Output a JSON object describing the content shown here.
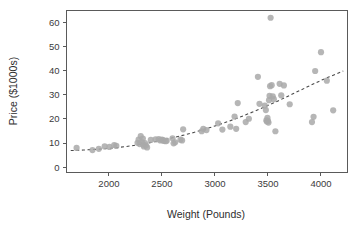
{
  "chart_data": {
    "type": "scatter",
    "title": "",
    "xlabel": "Weight (Pounds)",
    "ylabel": "Price ($1000s)",
    "xlim": [
      1600,
      4250
    ],
    "ylim": [
      -2,
      65
    ],
    "xticks": [
      2000,
      2500,
      3000,
      3500,
      4000
    ],
    "xtick_labels": [
      "2000",
      "2500",
      "3000",
      "3500",
      "4000"
    ],
    "yticks": [
      0,
      10,
      20,
      30,
      40,
      50,
      60
    ],
    "ytick_labels": [
      "0",
      "10",
      "20",
      "30",
      "40",
      "50",
      "60"
    ],
    "grid": false,
    "legend": null,
    "point_color": "#a9a9a9",
    "point_radius": 3.1,
    "axis_color": "#5a5a5a",
    "background": "#ffffff",
    "points": [
      {
        "x": 1695,
        "y": 8.0
      },
      {
        "x": 1845,
        "y": 7.1
      },
      {
        "x": 1905,
        "y": 7.6
      },
      {
        "x": 1960,
        "y": 8.6
      },
      {
        "x": 2005,
        "y": 8.4
      },
      {
        "x": 2050,
        "y": 9.2
      },
      {
        "x": 2070,
        "y": 8.8
      },
      {
        "x": 2270,
        "y": 10.1
      },
      {
        "x": 2280,
        "y": 11.4
      },
      {
        "x": 2290,
        "y": 9.6
      },
      {
        "x": 2300,
        "y": 12.9
      },
      {
        "x": 2310,
        "y": 10.4
      },
      {
        "x": 2320,
        "y": 11.9
      },
      {
        "x": 2325,
        "y": 9.3
      },
      {
        "x": 2330,
        "y": 8.6
      },
      {
        "x": 2340,
        "y": 10.0
      },
      {
        "x": 2350,
        "y": 9.0
      },
      {
        "x": 2360,
        "y": 8.2
      },
      {
        "x": 2395,
        "y": 11.3
      },
      {
        "x": 2440,
        "y": 11.5
      },
      {
        "x": 2470,
        "y": 11.6
      },
      {
        "x": 2485,
        "y": 11.1
      },
      {
        "x": 2500,
        "y": 11.4
      },
      {
        "x": 2510,
        "y": 11.2
      },
      {
        "x": 2520,
        "y": 10.9
      },
      {
        "x": 2535,
        "y": 10.8
      },
      {
        "x": 2545,
        "y": 11.0
      },
      {
        "x": 2600,
        "y": 12.0
      },
      {
        "x": 2610,
        "y": 9.9
      },
      {
        "x": 2625,
        "y": 10.3
      },
      {
        "x": 2675,
        "y": 11.4
      },
      {
        "x": 2690,
        "y": 11.1
      },
      {
        "x": 2700,
        "y": 15.7
      },
      {
        "x": 2875,
        "y": 14.9
      },
      {
        "x": 2890,
        "y": 15.9
      },
      {
        "x": 2920,
        "y": 15.4
      },
      {
        "x": 3030,
        "y": 18.2
      },
      {
        "x": 3070,
        "y": 15.6
      },
      {
        "x": 3145,
        "y": 16.8
      },
      {
        "x": 3185,
        "y": 21.0
      },
      {
        "x": 3200,
        "y": 15.9
      },
      {
        "x": 3215,
        "y": 26.6
      },
      {
        "x": 3290,
        "y": 18.7
      },
      {
        "x": 3320,
        "y": 20.1
      },
      {
        "x": 3405,
        "y": 37.5
      },
      {
        "x": 3420,
        "y": 26.3
      },
      {
        "x": 3470,
        "y": 25.5
      },
      {
        "x": 3480,
        "y": 23.7
      },
      {
        "x": 3485,
        "y": 19.4
      },
      {
        "x": 3490,
        "y": 18.9
      },
      {
        "x": 3495,
        "y": 20.5
      },
      {
        "x": 3500,
        "y": 19.2
      },
      {
        "x": 3505,
        "y": 18.5
      },
      {
        "x": 3510,
        "y": 27.8
      },
      {
        "x": 3515,
        "y": 29.6
      },
      {
        "x": 3520,
        "y": 33.6
      },
      {
        "x": 3525,
        "y": 62.0
      },
      {
        "x": 3535,
        "y": 34.0
      },
      {
        "x": 3545,
        "y": 29.4
      },
      {
        "x": 3555,
        "y": 28.2
      },
      {
        "x": 3570,
        "y": 14.9
      },
      {
        "x": 3610,
        "y": 34.6
      },
      {
        "x": 3625,
        "y": 29.8
      },
      {
        "x": 3650,
        "y": 33.9
      },
      {
        "x": 3705,
        "y": 26.1
      },
      {
        "x": 3915,
        "y": 18.7
      },
      {
        "x": 3930,
        "y": 20.9
      },
      {
        "x": 3945,
        "y": 39.9
      },
      {
        "x": 4000,
        "y": 47.7
      },
      {
        "x": 4055,
        "y": 35.9
      },
      {
        "x": 4115,
        "y": 23.6
      }
    ],
    "trend": {
      "style": "dashed",
      "description": "fitted quadratic trend",
      "points": [
        {
          "x": 1640,
          "y": 6.9
        },
        {
          "x": 1800,
          "y": 7.2
        },
        {
          "x": 2000,
          "y": 7.8
        },
        {
          "x": 2200,
          "y": 8.8
        },
        {
          "x": 2400,
          "y": 10.3
        },
        {
          "x": 2600,
          "y": 12.2
        },
        {
          "x": 2800,
          "y": 14.4
        },
        {
          "x": 3000,
          "y": 17.1
        },
        {
          "x": 3200,
          "y": 20.2
        },
        {
          "x": 3400,
          "y": 23.7
        },
        {
          "x": 3600,
          "y": 27.6
        },
        {
          "x": 3800,
          "y": 31.8
        },
        {
          "x": 4000,
          "y": 36.0
        },
        {
          "x": 4210,
          "y": 39.9
        }
      ]
    }
  },
  "figure": {
    "x_axis_title": "Weight (Pounds)",
    "y_axis_title": "Price ($1000s)"
  }
}
